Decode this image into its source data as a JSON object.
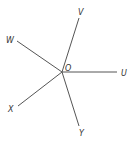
{
  "diagram": {
    "type": "geometry-rays",
    "center": {
      "label": "O",
      "x": 62,
      "y": 72,
      "label_x": 65,
      "label_y": 71
    },
    "rays": [
      {
        "id": "U",
        "label": "U",
        "x2": 117,
        "y2": 72,
        "label_x": 121,
        "label_y": 76
      },
      {
        "id": "V",
        "label": "V",
        "x2": 79,
        "y2": 18,
        "label_x": 78,
        "label_y": 15
      },
      {
        "id": "W",
        "label": "W",
        "x2": 17,
        "y2": 41,
        "label_x": 6,
        "label_y": 43
      },
      {
        "id": "X",
        "label": "X",
        "x2": 18,
        "y2": 106,
        "label_x": 8,
        "label_y": 112
      },
      {
        "id": "Y",
        "label": "Y",
        "x2": 79,
        "y2": 126,
        "label_x": 79,
        "label_y": 136
      }
    ],
    "colors": {
      "line": "#555555",
      "text": "#333333",
      "background": "#ffffff"
    }
  }
}
